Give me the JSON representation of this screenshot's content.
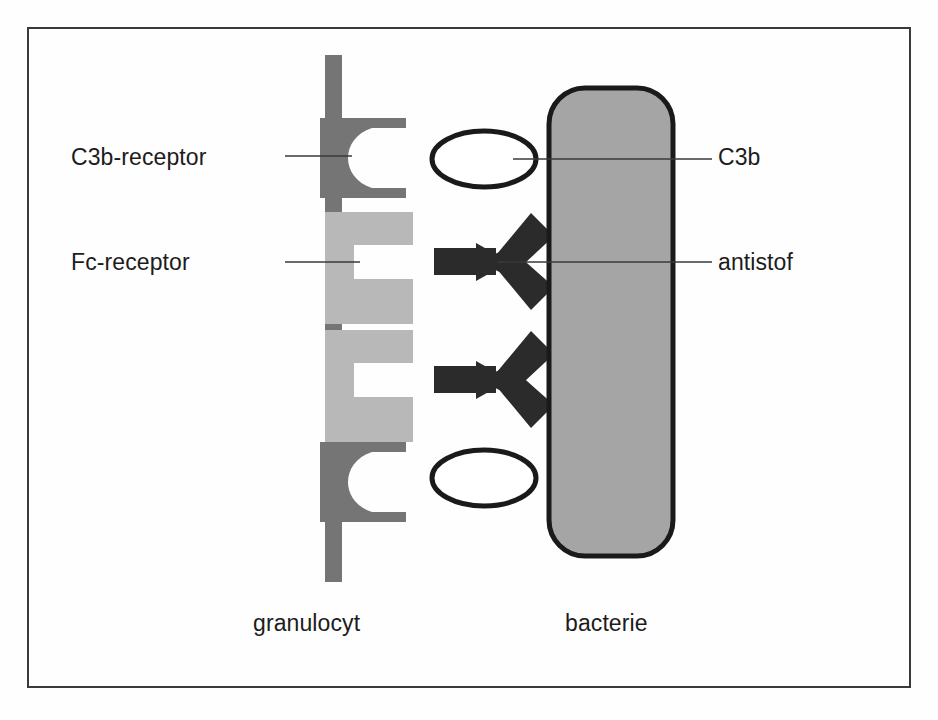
{
  "figure": {
    "kind": "biology-diagram",
    "frame_color": "#3a3a3a",
    "background_color": "#fefefe"
  },
  "labels": {
    "c3b_receptor": "C3b-receptor",
    "fc_receptor": "Fc-receptor",
    "c3b": "C3b",
    "antistof": "antistof",
    "granulocyt": "granulocyt",
    "bacterie": "bacterie"
  },
  "colors": {
    "membrane_dark_gray": "#757575",
    "c3b_receptor_gray": "#757575",
    "fc_receptor_light_gray": "#b8b8b8",
    "antibody_black": "#2b2b2b",
    "bacteria_fill": "#a5a5a5",
    "bacteria_outline": "#1a1a1a",
    "c3b_ellipse_fill": "#ffffff",
    "c3b_ellipse_outline": "#1a1a1a",
    "leader_line": "#3a3a3a",
    "text": "#1c1c1c"
  },
  "structures": {
    "granulocyte_membrane": {
      "name": "granulocyte cell membrane",
      "orientation": "vertical-bar",
      "receptor_counts": {
        "c3b_receptor": 2,
        "fc_receptor": 2
      }
    },
    "bacterium": {
      "name": "bacterium",
      "shape": "rounded-rectangle"
    },
    "c3b_molecules": {
      "name": "C3b opsonin",
      "shape": "ellipse",
      "count": 2
    },
    "antibodies": {
      "name": "antibody (antistof)",
      "shape": "y-shape-rotated",
      "count": 2
    }
  }
}
